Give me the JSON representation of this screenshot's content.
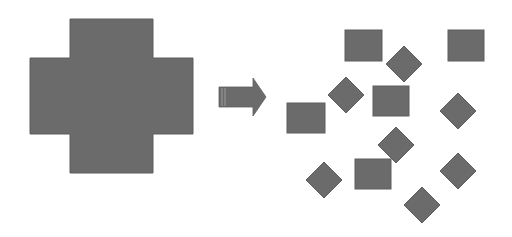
{
  "diagram": {
    "fill_color": "#6b6b6b",
    "edge_color": "#5e5e5e",
    "background": "#ffffff",
    "source_shape": {
      "type": "cross",
      "vertical_bar": {
        "x": 70,
        "y": 19,
        "w": 83,
        "h": 154
      },
      "horizontal_bar": {
        "x": 30,
        "y": 58,
        "w": 163,
        "h": 76
      }
    },
    "arrow": {
      "direction": "right",
      "shaft": {
        "x": 219,
        "y": 87,
        "w": 34,
        "h": 20
      },
      "head": {
        "base_x": 253,
        "top_y": 78,
        "bottom_y": 116,
        "tip_x": 266,
        "tip_y": 97
      }
    },
    "fragments": [
      {
        "type": "square",
        "x": 345,
        "y": 30,
        "w": 37,
        "h": 31
      },
      {
        "type": "square",
        "x": 448,
        "y": 30,
        "w": 36,
        "h": 31
      },
      {
        "type": "diamond",
        "cx": 404,
        "cy": 64,
        "r": 18
      },
      {
        "type": "diamond",
        "cx": 346,
        "cy": 95,
        "r": 18
      },
      {
        "type": "square",
        "x": 373,
        "y": 86,
        "w": 36,
        "h": 30
      },
      {
        "type": "square",
        "x": 287,
        "y": 103,
        "w": 38,
        "h": 30
      },
      {
        "type": "diamond",
        "cx": 458,
        "cy": 111,
        "r": 18
      },
      {
        "type": "diamond",
        "cx": 396,
        "cy": 145,
        "r": 18
      },
      {
        "type": "square",
        "x": 355,
        "y": 159,
        "w": 36,
        "h": 30
      },
      {
        "type": "diamond",
        "cx": 324,
        "cy": 180,
        "r": 18
      },
      {
        "type": "diamond",
        "cx": 458,
        "cy": 171,
        "r": 18
      },
      {
        "type": "diamond",
        "cx": 422,
        "cy": 205,
        "r": 18
      }
    ]
  }
}
